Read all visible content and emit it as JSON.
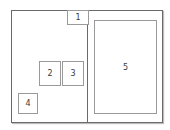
{
  "diagram": {
    "frame": {
      "left": 11,
      "top": 10,
      "width": 150,
      "height": 111
    },
    "divider_x": 75,
    "boxes": [
      {
        "label": "1",
        "left": 55,
        "top": -1,
        "width": 21,
        "height": 15
      },
      {
        "label": "2",
        "left": 27,
        "top": 50,
        "width": 21,
        "height": 25
      },
      {
        "label": "3",
        "left": 50,
        "top": 50,
        "width": 21,
        "height": 25
      },
      {
        "label": "4",
        "left": 6,
        "top": 82,
        "width": 20,
        "height": 21
      },
      {
        "label": "5",
        "left": 82,
        "top": 9,
        "width": 63,
        "height": 94
      }
    ],
    "colors": {
      "frame_border": "#6a6a6a",
      "box_border": "#9a9a9a",
      "text": "#3a3a3a",
      "background": "#ffffff"
    }
  }
}
